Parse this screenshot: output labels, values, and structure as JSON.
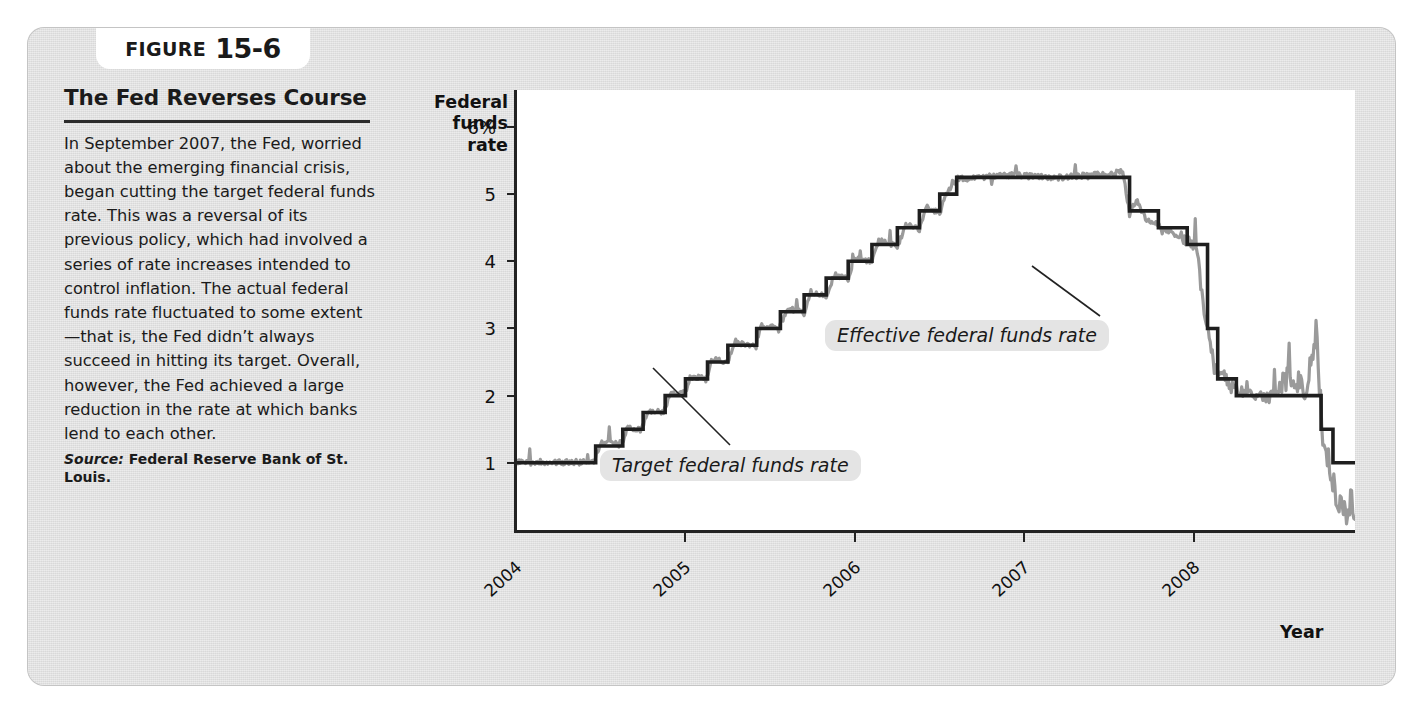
{
  "figure": {
    "badge_word": "FIGURE",
    "badge_number": "15-6",
    "title": "The Fed Reverses Course",
    "body": "In September 2007, the Fed, worried about the emerging financial crisis, began cutting the target federal funds rate. This was a reversal of its previous policy, which had involved a series of rate increases intended to control inflation. The actual federal funds rate fluctuated to some extent—that is, the Fed didn’t always succeed in hitting its target. Overall, however, the Fed achieved a large reduction in the rate at which banks lend to each other.",
    "source_label": "Source:",
    "source_text": " Federal Reserve Bank of St. Louis."
  },
  "chart_data": {
    "type": "line",
    "title": "",
    "xlabel": "Year",
    "ylabel": "Federal funds rate",
    "ylabel_lines": [
      "Federal",
      "funds",
      "rate"
    ],
    "ytick_labels": [
      "6%",
      "5",
      "4",
      "3",
      "2",
      "1"
    ],
    "ytick_values": [
      6,
      5,
      4,
      3,
      2,
      1
    ],
    "ylim": [
      0,
      6.55
    ],
    "xtick_labels": [
      "2004",
      "2005",
      "2006",
      "2007",
      "2008"
    ],
    "xlim": [
      2004.0,
      2008.95
    ],
    "grid": false,
    "legend_position": "inline-annotations",
    "annotations": [
      {
        "name": "target-annotation",
        "text": "Target federal funds rate"
      },
      {
        "name": "effective-annotation",
        "text": "Effective federal funds rate"
      }
    ],
    "colors": {
      "target": "#1e1e1e",
      "effective": "#9a9a9a",
      "panel": "#d9d9d9",
      "plot": "#ffffff"
    },
    "series": [
      {
        "name": "Target federal funds rate",
        "style": "step",
        "color": "#1e1e1e",
        "points": [
          [
            2004.0,
            1.0
          ],
          [
            2004.47,
            1.0
          ],
          [
            2004.47,
            1.25
          ],
          [
            2004.63,
            1.25
          ],
          [
            2004.63,
            1.5
          ],
          [
            2004.75,
            1.5
          ],
          [
            2004.75,
            1.75
          ],
          [
            2004.88,
            1.75
          ],
          [
            2004.88,
            2.0
          ],
          [
            2005.0,
            2.0
          ],
          [
            2005.0,
            2.25
          ],
          [
            2005.13,
            2.25
          ],
          [
            2005.13,
            2.5
          ],
          [
            2005.25,
            2.5
          ],
          [
            2005.25,
            2.75
          ],
          [
            2005.42,
            2.75
          ],
          [
            2005.42,
            3.0
          ],
          [
            2005.56,
            3.0
          ],
          [
            2005.56,
            3.25
          ],
          [
            2005.7,
            3.25
          ],
          [
            2005.7,
            3.5
          ],
          [
            2005.83,
            3.5
          ],
          [
            2005.83,
            3.75
          ],
          [
            2005.96,
            3.75
          ],
          [
            2005.96,
            4.0
          ],
          [
            2006.1,
            4.0
          ],
          [
            2006.1,
            4.25
          ],
          [
            2006.25,
            4.25
          ],
          [
            2006.25,
            4.5
          ],
          [
            2006.38,
            4.5
          ],
          [
            2006.38,
            4.75
          ],
          [
            2006.5,
            4.75
          ],
          [
            2006.5,
            5.0
          ],
          [
            2006.6,
            5.0
          ],
          [
            2006.6,
            5.25
          ],
          [
            2007.62,
            5.25
          ],
          [
            2007.62,
            4.75
          ],
          [
            2007.79,
            4.75
          ],
          [
            2007.79,
            4.5
          ],
          [
            2007.96,
            4.5
          ],
          [
            2007.96,
            4.25
          ],
          [
            2008.08,
            4.25
          ],
          [
            2008.08,
            3.0
          ],
          [
            2008.14,
            3.0
          ],
          [
            2008.14,
            2.25
          ],
          [
            2008.25,
            2.25
          ],
          [
            2008.25,
            2.0
          ],
          [
            2008.75,
            2.0
          ],
          [
            2008.75,
            1.5
          ],
          [
            2008.82,
            1.5
          ],
          [
            2008.82,
            1.0
          ],
          [
            2008.95,
            1.0
          ]
        ]
      },
      {
        "name": "Effective federal funds rate",
        "style": "noisy-line",
        "color": "#9a9a9a",
        "description": "Daily effective rate tracking the target with small fluctuations; large downward swings and spikes near late 2008, ending near 0.15%",
        "points": [
          [
            2004.0,
            1.0
          ],
          [
            2004.2,
            1.01
          ],
          [
            2004.46,
            1.0
          ],
          [
            2004.5,
            1.3
          ],
          [
            2004.62,
            1.26
          ],
          [
            2004.66,
            1.52
          ],
          [
            2004.74,
            1.48
          ],
          [
            2004.78,
            1.78
          ],
          [
            2004.87,
            1.74
          ],
          [
            2004.91,
            2.02
          ],
          [
            2005.0,
            2.05
          ],
          [
            2005.04,
            2.28
          ],
          [
            2005.12,
            2.24
          ],
          [
            2005.16,
            2.55
          ],
          [
            2005.25,
            2.48
          ],
          [
            2005.29,
            2.8
          ],
          [
            2005.41,
            2.72
          ],
          [
            2005.45,
            3.05
          ],
          [
            2005.55,
            2.98
          ],
          [
            2005.6,
            3.3
          ],
          [
            2005.7,
            3.22
          ],
          [
            2005.74,
            3.55
          ],
          [
            2005.83,
            3.47
          ],
          [
            2005.88,
            3.8
          ],
          [
            2005.96,
            3.72
          ],
          [
            2006.0,
            4.05
          ],
          [
            2006.1,
            3.98
          ],
          [
            2006.14,
            4.3
          ],
          [
            2006.25,
            4.22
          ],
          [
            2006.3,
            4.55
          ],
          [
            2006.38,
            4.47
          ],
          [
            2006.42,
            4.8
          ],
          [
            2006.5,
            4.72
          ],
          [
            2006.55,
            5.05
          ],
          [
            2006.6,
            5.22
          ],
          [
            2006.9,
            5.28
          ],
          [
            2007.2,
            5.24
          ],
          [
            2007.5,
            5.3
          ],
          [
            2007.58,
            5.33
          ],
          [
            2007.62,
            4.7
          ],
          [
            2007.66,
            4.9
          ],
          [
            2007.72,
            4.62
          ],
          [
            2007.8,
            4.52
          ],
          [
            2007.9,
            4.38
          ],
          [
            2007.97,
            4.28
          ],
          [
            2008.02,
            4.1
          ],
          [
            2008.06,
            3.2
          ],
          [
            2008.09,
            2.9
          ],
          [
            2008.12,
            2.4
          ],
          [
            2008.16,
            2.35
          ],
          [
            2008.22,
            2.12
          ],
          [
            2008.3,
            2.05
          ],
          [
            2008.45,
            1.96
          ],
          [
            2008.58,
            2.3
          ],
          [
            2008.66,
            2.0
          ],
          [
            2008.72,
            2.95
          ],
          [
            2008.76,
            1.4
          ],
          [
            2008.8,
            0.95
          ],
          [
            2008.85,
            0.35
          ],
          [
            2008.9,
            0.22
          ],
          [
            2008.93,
            0.45
          ],
          [
            2008.95,
            0.16
          ]
        ]
      }
    ]
  }
}
